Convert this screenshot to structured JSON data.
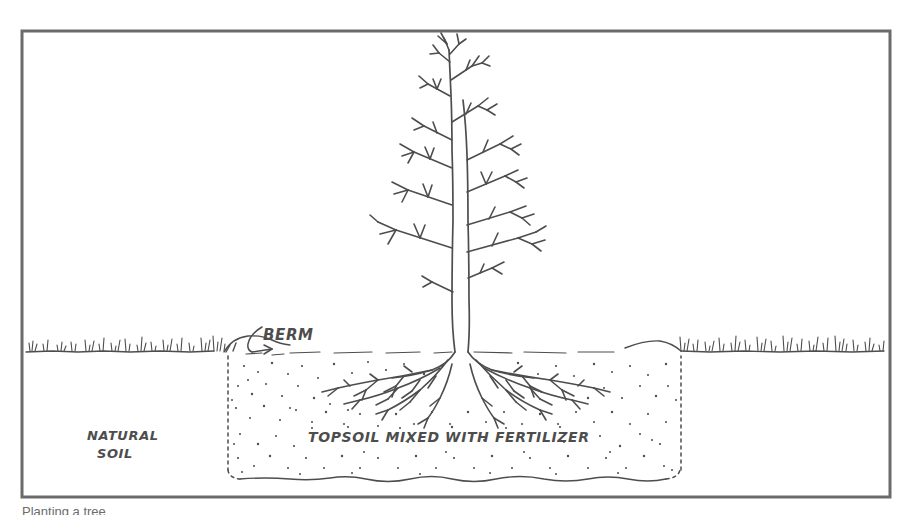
{
  "figure": {
    "kind": "hand-drawn-cross-section-illustration",
    "background_color": "#ffffff",
    "ink_color": "#4d4d4d",
    "border": {
      "name": "figure-border",
      "x": 22,
      "y": 31,
      "width": 868,
      "height": 466,
      "stroke_color": "#6b6b6b",
      "stroke_width": 3
    }
  },
  "labels": {
    "berm": "BERM",
    "natural_soil_line1": "NATURAL",
    "natural_soil_line2": "SOIL",
    "topsoil": "TOPSOIL MIXED WITH FERTILIZER"
  },
  "caption": {
    "text": "Planting a tree",
    "visible_fraction": "top-of-letters-only-cropped-at-image-edge"
  },
  "geometry": {
    "ground_line_y": 351,
    "pit_left_x": 228,
    "pit_right_x": 681,
    "pit_bottom_y": 478,
    "trunk_center_x": 461,
    "tree_top_y": 40,
    "root_spread_left_x": 330,
    "root_spread_right_x": 600,
    "root_depth_y": 400
  },
  "elements": {
    "tree": "bare-deciduous-sapling",
    "roots": "shallow-spreading-fibrous-roots",
    "berm": "raised-soil-rim-at-pit-edge",
    "pit_fill": "stippled-amended-topsoil",
    "grass": "grass-tufts-along-natural-grade",
    "pit_edge_style": "dotted-dashed"
  }
}
